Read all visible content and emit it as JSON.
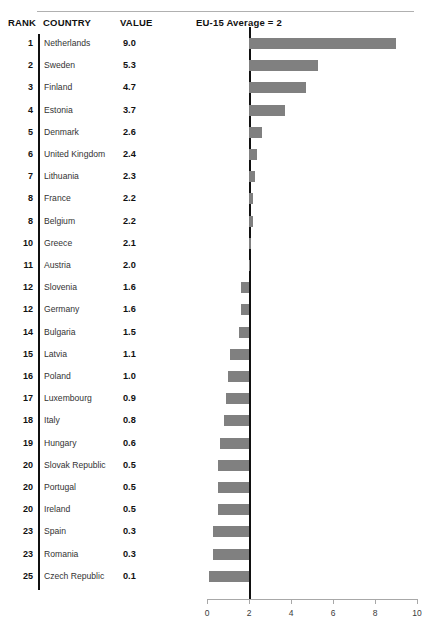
{
  "columns": {
    "rank": "RANK",
    "country": "COUNTRY",
    "value": "VALUE"
  },
  "reference": {
    "label": "EU-15 Average = 2",
    "value": 2
  },
  "chart_data": {
    "type": "bar",
    "title": "",
    "subtitle": "",
    "xlabel": "",
    "ylabel": "",
    "orientation": "horizontal",
    "grid": false,
    "legend": null,
    "xlim": [
      0,
      10
    ],
    "xticks": [
      0,
      2,
      4,
      6,
      8,
      10
    ],
    "xtick_labels": [
      "0",
      "2",
      "4",
      "6",
      "8",
      "10"
    ],
    "baseline": 2,
    "baseline_label": "EU-15 Average = 2",
    "bar_color": "#808080",
    "categories": [
      "Netherlands",
      "Sweden",
      "Finland",
      "Estonia",
      "Denmark",
      "United Kingdom",
      "Lithuania",
      "France",
      "Belgium",
      "Greece",
      "Austria",
      "Slovenia",
      "Germany",
      "Bulgaria",
      "Latvia",
      "Poland",
      "Luxembourg",
      "Italy",
      "Hungary",
      "Slovak Republic",
      "Portugal",
      "Ireland",
      "Spain",
      "Romania",
      "Czech Republic"
    ],
    "values": [
      9.0,
      5.3,
      4.7,
      3.7,
      2.6,
      2.4,
      2.3,
      2.2,
      2.2,
      2.1,
      2.0,
      1.6,
      1.6,
      1.5,
      1.1,
      1.0,
      0.9,
      0.8,
      0.6,
      0.5,
      0.5,
      0.5,
      0.3,
      0.3,
      0.1
    ],
    "ranks": [
      1,
      2,
      3,
      4,
      5,
      6,
      7,
      8,
      8,
      10,
      11,
      12,
      12,
      14,
      15,
      16,
      17,
      18,
      19,
      20,
      20,
      20,
      23,
      23,
      25
    ]
  },
  "rows": [
    {
      "rank": "1",
      "country": "Netherlands",
      "value": "9.0",
      "num": 9.0
    },
    {
      "rank": "2",
      "country": "Sweden",
      "value": "5.3",
      "num": 5.3
    },
    {
      "rank": "3",
      "country": "Finland",
      "value": "4.7",
      "num": 4.7
    },
    {
      "rank": "4",
      "country": "Estonia",
      "value": "3.7",
      "num": 3.7
    },
    {
      "rank": "5",
      "country": "Denmark",
      "value": "2.6",
      "num": 2.6
    },
    {
      "rank": "6",
      "country": "United Kingdom",
      "value": "2.4",
      "num": 2.4
    },
    {
      "rank": "7",
      "country": "Lithuania",
      "value": "2.3",
      "num": 2.3
    },
    {
      "rank": "8",
      "country": "France",
      "value": "2.2",
      "num": 2.2
    },
    {
      "rank": "8",
      "country": "Belgium",
      "value": "2.2",
      "num": 2.2
    },
    {
      "rank": "10",
      "country": "Greece",
      "value": "2.1",
      "num": 2.1
    },
    {
      "rank": "11",
      "country": "Austria",
      "value": "2.0",
      "num": 2.0
    },
    {
      "rank": "12",
      "country": "Slovenia",
      "value": "1.6",
      "num": 1.6
    },
    {
      "rank": "12",
      "country": "Germany",
      "value": "1.6",
      "num": 1.6
    },
    {
      "rank": "14",
      "country": "Bulgaria",
      "value": "1.5",
      "num": 1.5
    },
    {
      "rank": "15",
      "country": "Latvia",
      "value": "1.1",
      "num": 1.1
    },
    {
      "rank": "16",
      "country": "Poland",
      "value": "1.0",
      "num": 1.0
    },
    {
      "rank": "17",
      "country": "Luxembourg",
      "value": "0.9",
      "num": 0.9
    },
    {
      "rank": "18",
      "country": "Italy",
      "value": "0.8",
      "num": 0.8
    },
    {
      "rank": "19",
      "country": "Hungary",
      "value": "0.6",
      "num": 0.6
    },
    {
      "rank": "20",
      "country": "Slovak Republic",
      "value": "0.5",
      "num": 0.5
    },
    {
      "rank": "20",
      "country": "Portugal",
      "value": "0.5",
      "num": 0.5
    },
    {
      "rank": "20",
      "country": "Ireland",
      "value": "0.5",
      "num": 0.5
    },
    {
      "rank": "23",
      "country": "Spain",
      "value": "0.3",
      "num": 0.3
    },
    {
      "rank": "23",
      "country": "Romania",
      "value": "0.3",
      "num": 0.3
    },
    {
      "rank": "25",
      "country": "Czech Republic",
      "value": "0.1",
      "num": 0.1
    }
  ],
  "axis": {
    "ticks": [
      "0",
      "2",
      "4",
      "6",
      "8",
      "10"
    ]
  }
}
